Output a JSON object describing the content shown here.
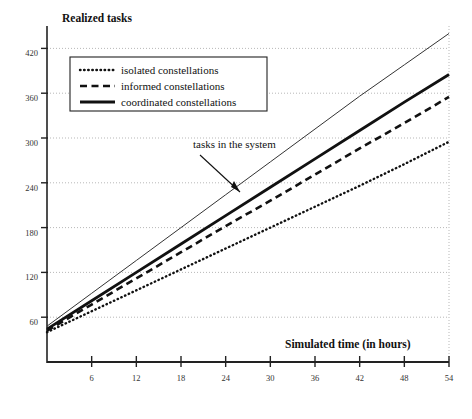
{
  "chart_data": {
    "type": "line",
    "title": "Realized tasks",
    "ylabel": "Realized tasks",
    "xlabel": "Simulated time (in hours)",
    "xlim": [
      0,
      54
    ],
    "ylim": [
      0,
      450
    ],
    "grid": true,
    "legend_position": "upper-left",
    "xticks": [
      6,
      12,
      18,
      24,
      30,
      36,
      42,
      48,
      54
    ],
    "yticks": [
      60,
      120,
      180,
      240,
      300,
      360,
      420
    ],
    "x": [
      0,
      6,
      12,
      18,
      24,
      30,
      36,
      42,
      48,
      54
    ],
    "series": [
      {
        "name": "tasks in the system",
        "style": "thin-solid",
        "color": "#333333",
        "values": [
          48,
          92,
          136,
          180,
          224,
          268,
          312,
          356,
          398,
          440
        ]
      },
      {
        "name": "coordinated constellations",
        "style": "thick-solid",
        "color": "#111111",
        "values": [
          44,
          82,
          120,
          158,
          196,
          234,
          272,
          310,
          348,
          385
        ]
      },
      {
        "name": "informed constellations",
        "style": "dashed",
        "color": "#111111",
        "values": [
          42,
          77,
          112,
          147,
          182,
          216,
          251,
          286,
          320,
          355
        ]
      },
      {
        "name": "isolated constellations",
        "style": "dotted",
        "color": "#111111",
        "values": [
          40,
          68,
          96,
          124,
          152,
          180,
          208,
          236,
          265,
          295
        ]
      }
    ],
    "annotations": [
      {
        "text": "tasks in the system",
        "x": 24,
        "y": 300
      }
    ]
  },
  "legend": {
    "items": [
      {
        "label": "isolated constellations",
        "style": "dotted"
      },
      {
        "label": "informed constellations",
        "style": "dashed"
      },
      {
        "label": "coordinated constellations",
        "style": "thick-solid"
      }
    ]
  },
  "axis": {
    "y_title": "Realized tasks",
    "x_title": "Simulated time (in hours)",
    "yticks": [
      "60",
      "120",
      "180",
      "240",
      "300",
      "360",
      "420"
    ],
    "xticks": [
      "6",
      "12",
      "18",
      "24",
      "30",
      "36",
      "42",
      "48",
      "54"
    ]
  },
  "annotation": {
    "text": "tasks in the system"
  }
}
